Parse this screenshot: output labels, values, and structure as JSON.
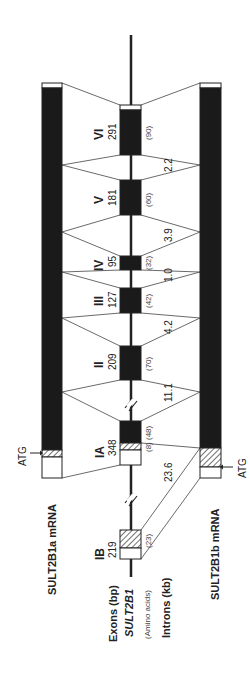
{
  "figure": {
    "orientation": "rotated-90-ccw",
    "gene_name": "SULT2B1",
    "legend": {
      "exons_label": "Exons (bp)",
      "gene_label": "SULT2B1",
      "amino_acids_label": "(Amino acids)",
      "introns_label": "Introns (kb)"
    },
    "mrna": [
      {
        "name": "SULT2B1a mRNA",
        "start_codon": "ATG"
      },
      {
        "name": "SULT2B1b mRNA",
        "start_codon": "ATG"
      }
    ],
    "exons": [
      {
        "id": "IB",
        "bp": "219",
        "aa": "(23)"
      },
      {
        "id": "IA",
        "bp": "348",
        "aa": "(48)",
        "aa_extra": "(8)"
      },
      {
        "id": "II",
        "bp": "209",
        "aa": "(70)"
      },
      {
        "id": "III",
        "bp": "127",
        "aa": "(42)"
      },
      {
        "id": "IV",
        "bp": "95",
        "aa": "(32)"
      },
      {
        "id": "V",
        "bp": "181",
        "aa": "(60)"
      },
      {
        "id": "VI",
        "bp": "291",
        "aa": "(90)"
      }
    ],
    "introns": [
      {
        "between": "IB-IA",
        "kb": "23.6"
      },
      {
        "between": "IA-II",
        "kb": "11.1"
      },
      {
        "between": "II-III",
        "kb": "4.2"
      },
      {
        "between": "III-IV",
        "kb": "1.0"
      },
      {
        "between": "IV-V",
        "kb": "3.9"
      },
      {
        "between": "V-VI",
        "kb": "2.2"
      }
    ],
    "colors": {
      "coding": "#1a1a1a",
      "utr": "#ffffff",
      "line": "#222222"
    }
  }
}
